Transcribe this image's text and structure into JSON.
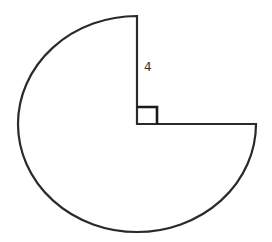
{
  "figure": {
    "type": "circle-sector",
    "radius_label": "4",
    "right_angle_marker": true,
    "sector_angle_degrees": 270,
    "colors": {
      "stroke": "#2a2a2a",
      "fill": "#ffffff",
      "background": "#ffffff"
    }
  }
}
